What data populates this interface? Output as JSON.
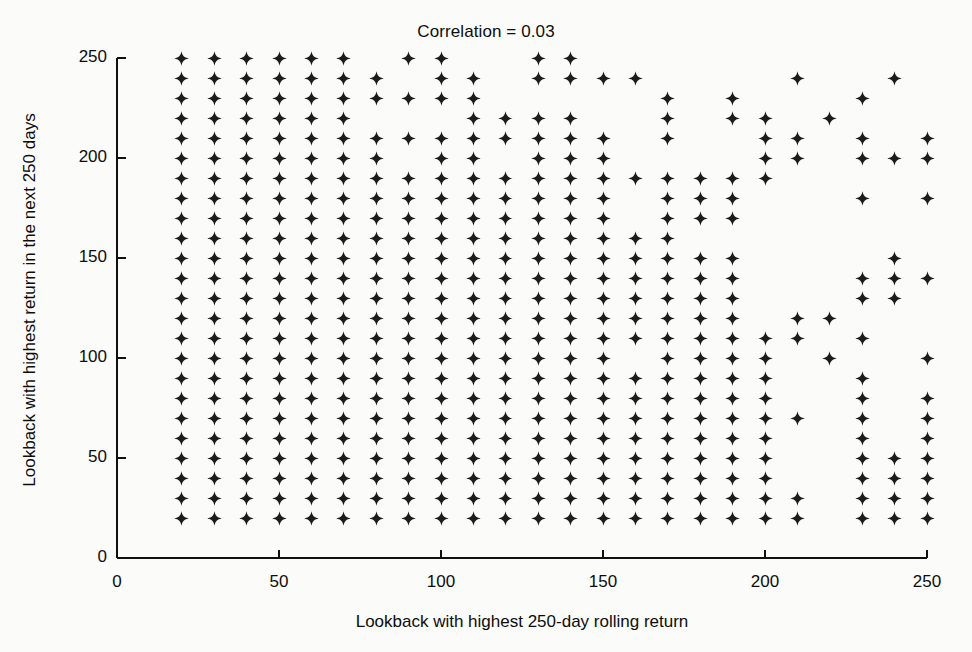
{
  "chart_data": {
    "type": "scatter",
    "title": "Correlation = 0.03",
    "xlabel": "Lookback with highest 250-day rolling return",
    "ylabel": "Lookback with highest return in the next 250 days",
    "xlim": [
      0,
      250
    ],
    "ylim": [
      0,
      250
    ],
    "xticks": [
      0,
      50,
      100,
      150,
      200,
      250
    ],
    "yticks": [
      0,
      50,
      100,
      150,
      200,
      250
    ],
    "xtick_labels": [
      "0",
      "50",
      "100",
      "150",
      "200",
      "250"
    ],
    "ytick_labels": [
      "0",
      "50",
      "100",
      "150",
      "200",
      "250"
    ],
    "grid": false,
    "legend": null,
    "marker": "four-pointed-star",
    "marker_color": "#1c1c1c",
    "annotations": [
      {
        "text": "Correlation = 0.03",
        "position": "top-center"
      }
    ],
    "points": [
      [
        20,
        250
      ],
      [
        30,
        250
      ],
      [
        40,
        250
      ],
      [
        50,
        250
      ],
      [
        60,
        250
      ],
      [
        70,
        250
      ],
      [
        90,
        250
      ],
      [
        100,
        250
      ],
      [
        130,
        250
      ],
      [
        140,
        250
      ],
      [
        20,
        240
      ],
      [
        30,
        240
      ],
      [
        40,
        240
      ],
      [
        50,
        240
      ],
      [
        60,
        240
      ],
      [
        70,
        240
      ],
      [
        80,
        240
      ],
      [
        100,
        240
      ],
      [
        110,
        240
      ],
      [
        130,
        240
      ],
      [
        140,
        240
      ],
      [
        150,
        240
      ],
      [
        160,
        240
      ],
      [
        210,
        240
      ],
      [
        240,
        240
      ],
      [
        20,
        230
      ],
      [
        30,
        230
      ],
      [
        40,
        230
      ],
      [
        50,
        230
      ],
      [
        60,
        230
      ],
      [
        70,
        230
      ],
      [
        80,
        230
      ],
      [
        90,
        230
      ],
      [
        100,
        230
      ],
      [
        110,
        230
      ],
      [
        170,
        230
      ],
      [
        190,
        230
      ],
      [
        230,
        230
      ],
      [
        20,
        220
      ],
      [
        30,
        220
      ],
      [
        40,
        220
      ],
      [
        50,
        220
      ],
      [
        60,
        220
      ],
      [
        70,
        220
      ],
      [
        110,
        220
      ],
      [
        120,
        220
      ],
      [
        130,
        220
      ],
      [
        140,
        220
      ],
      [
        170,
        220
      ],
      [
        190,
        220
      ],
      [
        200,
        220
      ],
      [
        220,
        220
      ],
      [
        20,
        210
      ],
      [
        30,
        210
      ],
      [
        40,
        210
      ],
      [
        50,
        210
      ],
      [
        60,
        210
      ],
      [
        70,
        210
      ],
      [
        80,
        210
      ],
      [
        90,
        210
      ],
      [
        100,
        210
      ],
      [
        110,
        210
      ],
      [
        120,
        210
      ],
      [
        130,
        210
      ],
      [
        140,
        210
      ],
      [
        150,
        210
      ],
      [
        170,
        210
      ],
      [
        200,
        210
      ],
      [
        210,
        210
      ],
      [
        230,
        210
      ],
      [
        250,
        210
      ],
      [
        20,
        200
      ],
      [
        30,
        200
      ],
      [
        40,
        200
      ],
      [
        50,
        200
      ],
      [
        60,
        200
      ],
      [
        70,
        200
      ],
      [
        80,
        200
      ],
      [
        100,
        200
      ],
      [
        110,
        200
      ],
      [
        130,
        200
      ],
      [
        140,
        200
      ],
      [
        150,
        200
      ],
      [
        200,
        200
      ],
      [
        210,
        200
      ],
      [
        230,
        200
      ],
      [
        240,
        200
      ],
      [
        250,
        200
      ],
      [
        20,
        190
      ],
      [
        30,
        190
      ],
      [
        40,
        190
      ],
      [
        50,
        190
      ],
      [
        60,
        190
      ],
      [
        70,
        190
      ],
      [
        80,
        190
      ],
      [
        90,
        190
      ],
      [
        100,
        190
      ],
      [
        110,
        190
      ],
      [
        120,
        190
      ],
      [
        130,
        190
      ],
      [
        140,
        190
      ],
      [
        150,
        190
      ],
      [
        160,
        190
      ],
      [
        170,
        190
      ],
      [
        180,
        190
      ],
      [
        190,
        190
      ],
      [
        200,
        190
      ],
      [
        20,
        180
      ],
      [
        30,
        180
      ],
      [
        40,
        180
      ],
      [
        50,
        180
      ],
      [
        60,
        180
      ],
      [
        70,
        180
      ],
      [
        80,
        180
      ],
      [
        90,
        180
      ],
      [
        100,
        180
      ],
      [
        110,
        180
      ],
      [
        120,
        180
      ],
      [
        130,
        180
      ],
      [
        140,
        180
      ],
      [
        150,
        180
      ],
      [
        170,
        180
      ],
      [
        180,
        180
      ],
      [
        190,
        180
      ],
      [
        230,
        180
      ],
      [
        250,
        180
      ],
      [
        20,
        170
      ],
      [
        30,
        170
      ],
      [
        40,
        170
      ],
      [
        50,
        170
      ],
      [
        60,
        170
      ],
      [
        70,
        170
      ],
      [
        80,
        170
      ],
      [
        90,
        170
      ],
      [
        100,
        170
      ],
      [
        110,
        170
      ],
      [
        120,
        170
      ],
      [
        130,
        170
      ],
      [
        140,
        170
      ],
      [
        150,
        170
      ],
      [
        170,
        170
      ],
      [
        180,
        170
      ],
      [
        190,
        170
      ],
      [
        20,
        160
      ],
      [
        30,
        160
      ],
      [
        40,
        160
      ],
      [
        50,
        160
      ],
      [
        60,
        160
      ],
      [
        70,
        160
      ],
      [
        80,
        160
      ],
      [
        90,
        160
      ],
      [
        100,
        160
      ],
      [
        110,
        160
      ],
      [
        120,
        160
      ],
      [
        130,
        160
      ],
      [
        140,
        160
      ],
      [
        150,
        160
      ],
      [
        160,
        160
      ],
      [
        170,
        160
      ],
      [
        20,
        150
      ],
      [
        30,
        150
      ],
      [
        40,
        150
      ],
      [
        50,
        150
      ],
      [
        60,
        150
      ],
      [
        70,
        150
      ],
      [
        80,
        150
      ],
      [
        90,
        150
      ],
      [
        100,
        150
      ],
      [
        110,
        150
      ],
      [
        120,
        150
      ],
      [
        130,
        150
      ],
      [
        140,
        150
      ],
      [
        150,
        150
      ],
      [
        160,
        150
      ],
      [
        170,
        150
      ],
      [
        180,
        150
      ],
      [
        190,
        150
      ],
      [
        240,
        150
      ],
      [
        20,
        140
      ],
      [
        30,
        140
      ],
      [
        40,
        140
      ],
      [
        50,
        140
      ],
      [
        60,
        140
      ],
      [
        70,
        140
      ],
      [
        80,
        140
      ],
      [
        90,
        140
      ],
      [
        100,
        140
      ],
      [
        110,
        140
      ],
      [
        120,
        140
      ],
      [
        130,
        140
      ],
      [
        140,
        140
      ],
      [
        150,
        140
      ],
      [
        160,
        140
      ],
      [
        170,
        140
      ],
      [
        180,
        140
      ],
      [
        190,
        140
      ],
      [
        230,
        140
      ],
      [
        240,
        140
      ],
      [
        250,
        140
      ],
      [
        20,
        130
      ],
      [
        30,
        130
      ],
      [
        40,
        130
      ],
      [
        50,
        130
      ],
      [
        60,
        130
      ],
      [
        70,
        130
      ],
      [
        80,
        130
      ],
      [
        90,
        130
      ],
      [
        100,
        130
      ],
      [
        110,
        130
      ],
      [
        120,
        130
      ],
      [
        130,
        130
      ],
      [
        140,
        130
      ],
      [
        150,
        130
      ],
      [
        160,
        130
      ],
      [
        170,
        130
      ],
      [
        180,
        130
      ],
      [
        190,
        130
      ],
      [
        230,
        130
      ],
      [
        240,
        130
      ],
      [
        20,
        120
      ],
      [
        30,
        120
      ],
      [
        40,
        120
      ],
      [
        50,
        120
      ],
      [
        60,
        120
      ],
      [
        70,
        120
      ],
      [
        80,
        120
      ],
      [
        90,
        120
      ],
      [
        100,
        120
      ],
      [
        110,
        120
      ],
      [
        120,
        120
      ],
      [
        130,
        120
      ],
      [
        140,
        120
      ],
      [
        150,
        120
      ],
      [
        160,
        120
      ],
      [
        170,
        120
      ],
      [
        180,
        120
      ],
      [
        190,
        120
      ],
      [
        210,
        120
      ],
      [
        220,
        120
      ],
      [
        20,
        110
      ],
      [
        30,
        110
      ],
      [
        40,
        110
      ],
      [
        50,
        110
      ],
      [
        60,
        110
      ],
      [
        70,
        110
      ],
      [
        80,
        110
      ],
      [
        90,
        110
      ],
      [
        100,
        110
      ],
      [
        110,
        110
      ],
      [
        120,
        110
      ],
      [
        130,
        110
      ],
      [
        140,
        110
      ],
      [
        150,
        110
      ],
      [
        160,
        110
      ],
      [
        170,
        110
      ],
      [
        180,
        110
      ],
      [
        190,
        110
      ],
      [
        200,
        110
      ],
      [
        210,
        110
      ],
      [
        230,
        110
      ],
      [
        20,
        100
      ],
      [
        30,
        100
      ],
      [
        40,
        100
      ],
      [
        50,
        100
      ],
      [
        60,
        100
      ],
      [
        70,
        100
      ],
      [
        80,
        100
      ],
      [
        90,
        100
      ],
      [
        100,
        100
      ],
      [
        110,
        100
      ],
      [
        120,
        100
      ],
      [
        130,
        100
      ],
      [
        140,
        100
      ],
      [
        150,
        100
      ],
      [
        170,
        100
      ],
      [
        180,
        100
      ],
      [
        190,
        100
      ],
      [
        200,
        100
      ],
      [
        220,
        100
      ],
      [
        250,
        100
      ],
      [
        20,
        90
      ],
      [
        30,
        90
      ],
      [
        40,
        90
      ],
      [
        50,
        90
      ],
      [
        60,
        90
      ],
      [
        70,
        90
      ],
      [
        80,
        90
      ],
      [
        90,
        90
      ],
      [
        100,
        90
      ],
      [
        110,
        90
      ],
      [
        120,
        90
      ],
      [
        130,
        90
      ],
      [
        140,
        90
      ],
      [
        150,
        90
      ],
      [
        160,
        90
      ],
      [
        170,
        90
      ],
      [
        180,
        90
      ],
      [
        190,
        90
      ],
      [
        200,
        90
      ],
      [
        230,
        90
      ],
      [
        20,
        80
      ],
      [
        30,
        80
      ],
      [
        40,
        80
      ],
      [
        50,
        80
      ],
      [
        60,
        80
      ],
      [
        70,
        80
      ],
      [
        80,
        80
      ],
      [
        90,
        80
      ],
      [
        100,
        80
      ],
      [
        110,
        80
      ],
      [
        120,
        80
      ],
      [
        130,
        80
      ],
      [
        140,
        80
      ],
      [
        150,
        80
      ],
      [
        160,
        80
      ],
      [
        170,
        80
      ],
      [
        180,
        80
      ],
      [
        190,
        80
      ],
      [
        200,
        80
      ],
      [
        230,
        80
      ],
      [
        250,
        80
      ],
      [
        20,
        70
      ],
      [
        30,
        70
      ],
      [
        40,
        70
      ],
      [
        50,
        70
      ],
      [
        60,
        70
      ],
      [
        70,
        70
      ],
      [
        80,
        70
      ],
      [
        90,
        70
      ],
      [
        100,
        70
      ],
      [
        110,
        70
      ],
      [
        120,
        70
      ],
      [
        130,
        70
      ],
      [
        140,
        70
      ],
      [
        150,
        70
      ],
      [
        160,
        70
      ],
      [
        170,
        70
      ],
      [
        180,
        70
      ],
      [
        190,
        70
      ],
      [
        200,
        70
      ],
      [
        210,
        70
      ],
      [
        230,
        70
      ],
      [
        250,
        70
      ],
      [
        20,
        60
      ],
      [
        30,
        60
      ],
      [
        40,
        60
      ],
      [
        50,
        60
      ],
      [
        60,
        60
      ],
      [
        70,
        60
      ],
      [
        80,
        60
      ],
      [
        90,
        60
      ],
      [
        100,
        60
      ],
      [
        110,
        60
      ],
      [
        120,
        60
      ],
      [
        130,
        60
      ],
      [
        140,
        60
      ],
      [
        150,
        60
      ],
      [
        160,
        60
      ],
      [
        170,
        60
      ],
      [
        180,
        60
      ],
      [
        190,
        60
      ],
      [
        200,
        60
      ],
      [
        230,
        60
      ],
      [
        250,
        60
      ],
      [
        20,
        50
      ],
      [
        30,
        50
      ],
      [
        40,
        50
      ],
      [
        50,
        50
      ],
      [
        60,
        50
      ],
      [
        70,
        50
      ],
      [
        80,
        50
      ],
      [
        90,
        50
      ],
      [
        100,
        50
      ],
      [
        110,
        50
      ],
      [
        120,
        50
      ],
      [
        130,
        50
      ],
      [
        140,
        50
      ],
      [
        150,
        50
      ],
      [
        160,
        50
      ],
      [
        170,
        50
      ],
      [
        180,
        50
      ],
      [
        190,
        50
      ],
      [
        200,
        50
      ],
      [
        230,
        50
      ],
      [
        240,
        50
      ],
      [
        250,
        50
      ],
      [
        20,
        40
      ],
      [
        30,
        40
      ],
      [
        40,
        40
      ],
      [
        50,
        40
      ],
      [
        60,
        40
      ],
      [
        70,
        40
      ],
      [
        80,
        40
      ],
      [
        90,
        40
      ],
      [
        100,
        40
      ],
      [
        110,
        40
      ],
      [
        120,
        40
      ],
      [
        130,
        40
      ],
      [
        140,
        40
      ],
      [
        150,
        40
      ],
      [
        160,
        40
      ],
      [
        170,
        40
      ],
      [
        180,
        40
      ],
      [
        190,
        40
      ],
      [
        200,
        40
      ],
      [
        230,
        40
      ],
      [
        240,
        40
      ],
      [
        250,
        40
      ],
      [
        20,
        30
      ],
      [
        30,
        30
      ],
      [
        40,
        30
      ],
      [
        50,
        30
      ],
      [
        60,
        30
      ],
      [
        70,
        30
      ],
      [
        80,
        30
      ],
      [
        90,
        30
      ],
      [
        100,
        30
      ],
      [
        110,
        30
      ],
      [
        120,
        30
      ],
      [
        130,
        30
      ],
      [
        140,
        30
      ],
      [
        150,
        30
      ],
      [
        160,
        30
      ],
      [
        170,
        30
      ],
      [
        180,
        30
      ],
      [
        190,
        30
      ],
      [
        200,
        30
      ],
      [
        210,
        30
      ],
      [
        230,
        30
      ],
      [
        240,
        30
      ],
      [
        250,
        30
      ],
      [
        20,
        20
      ],
      [
        30,
        20
      ],
      [
        40,
        20
      ],
      [
        50,
        20
      ],
      [
        60,
        20
      ],
      [
        70,
        20
      ],
      [
        80,
        20
      ],
      [
        90,
        20
      ],
      [
        100,
        20
      ],
      [
        110,
        20
      ],
      [
        120,
        20
      ],
      [
        130,
        20
      ],
      [
        140,
        20
      ],
      [
        150,
        20
      ],
      [
        160,
        20
      ],
      [
        170,
        20
      ],
      [
        180,
        20
      ],
      [
        190,
        20
      ],
      [
        200,
        20
      ],
      [
        210,
        20
      ],
      [
        230,
        20
      ],
      [
        240,
        20
      ],
      [
        250,
        20
      ]
    ]
  }
}
